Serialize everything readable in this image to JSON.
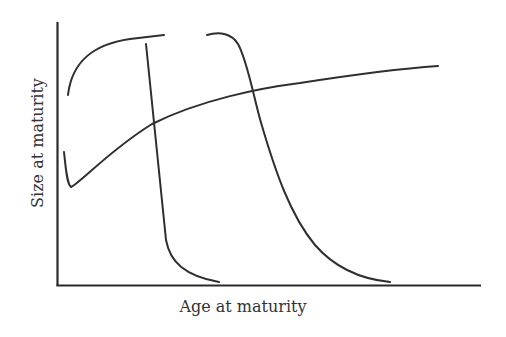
{
  "chart_data": {
    "type": "line",
    "title": "",
    "xlabel": "Age at maturity",
    "ylabel": "Size at maturity",
    "grid": false,
    "legend": null,
    "ticks": false,
    "colors": {
      "axis": "#2a2a2a",
      "curve": "#2f2f2f",
      "text": "#333333",
      "background": "#ffffff"
    },
    "series": [
      {
        "name": "saturating-rise-curve",
        "description": "Rapid concave rise from mid-height, leveling near top (left)",
        "path": "M68,95 C72,60 95,44 130,39 L164,35"
      },
      {
        "name": "steep-decline-curve-1",
        "description": "Near-vertical drop then tail along x-axis",
        "path": "M146,44 L166,240 C170,262 185,276 219,282"
      },
      {
        "name": "plateau-then-decline-curve",
        "description": "Flat top then curving decline to x-axis",
        "path": "M207,35 C220,31 232,34 238,44 C248,62 254,100 262,126 C275,170 290,215 315,245 C335,268 360,279 390,282"
      },
      {
        "name": "rising-curve-with-initial-dip",
        "description": "Starts high at left, dips, then rises gradually across",
        "path": "M64,152 C66,170 67,184 71,187 C80,183 110,150 152,124 C200,100 260,88 300,83 C345,76 395,69 438,66"
      }
    ]
  },
  "axes": {
    "x_label": "Age at maturity",
    "y_label": "Size at maturity"
  }
}
